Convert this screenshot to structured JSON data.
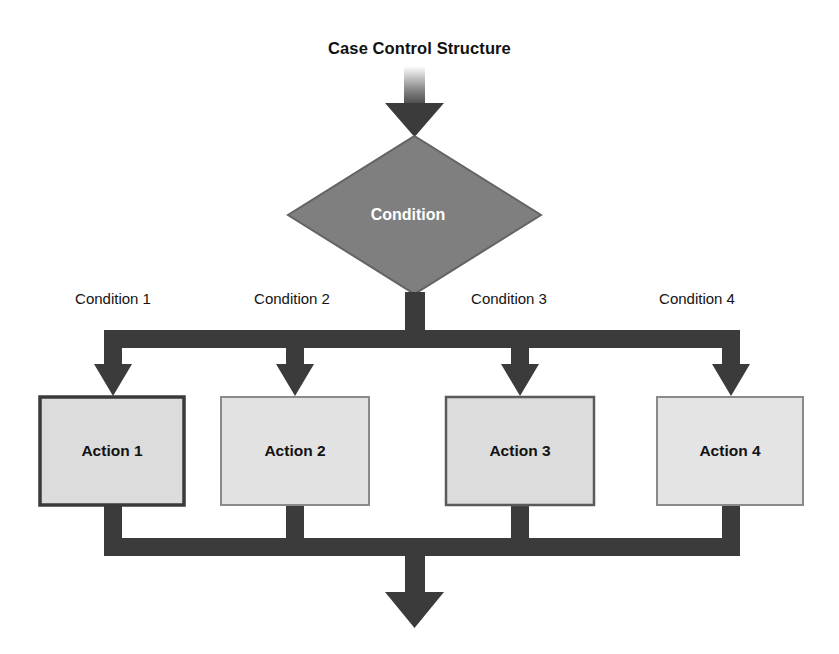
{
  "diagram": {
    "title": "Case Control Structure",
    "type": "flowchart",
    "decision": {
      "label": "Condition",
      "shape": "diamond",
      "fill": "#7f7f7f",
      "text_color": "#ffffff"
    },
    "branch_labels": [
      "Condition 1",
      "Condition 2",
      "Condition 3",
      "Condition 4"
    ],
    "actions": [
      {
        "label": "Action 1"
      },
      {
        "label": "Action 2"
      },
      {
        "label": "Action 3"
      },
      {
        "label": "Action 4"
      }
    ],
    "colors": {
      "connector": "#3b3b3b",
      "decision_fill": "#7f7f7f",
      "action_fill": "#dcdcdc",
      "action_border": "#4a4a4a",
      "background": "#ffffff",
      "title_text": "#111111"
    },
    "connectors": {
      "entry_arrow": "down-arrow",
      "exit_arrow": "down-arrow",
      "split_bar": "horizontal-bar",
      "merge_bar": "horizontal-bar"
    }
  }
}
